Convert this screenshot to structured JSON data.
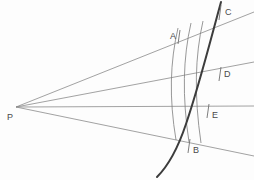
{
  "figure": {
    "background_color": "#fdfdfd",
    "width": 254,
    "height": 180
  },
  "colors": {
    "thin_line": "#8a8a8a",
    "arc_line": "#7d7d7d",
    "thick_curve": "#3c3c3c",
    "tick": "#6f6f6f",
    "label_text": "#4a4a4a"
  },
  "vertex": {
    "name": "P",
    "label": "P",
    "x": 16,
    "y": 107,
    "label_x": 7,
    "label_y": 113
  },
  "labels": [
    {
      "id": "A",
      "text": "A",
      "x": 170,
      "y": 32
    },
    {
      "id": "C",
      "text": "C",
      "x": 225,
      "y": 8
    },
    {
      "id": "D",
      "text": "D",
      "x": 224,
      "y": 70
    },
    {
      "id": "E",
      "text": "E",
      "x": 212,
      "y": 111
    },
    {
      "id": "B",
      "text": "B",
      "x": 193,
      "y": 146
    },
    {
      "id": "P",
      "text": "P",
      "x": 7,
      "y": 113
    }
  ],
  "rays": [
    {
      "id": "ray-to-C",
      "from_x": 16,
      "from_y": 107,
      "to_x": 254,
      "to_y": 12
    },
    {
      "id": "ray-to-D",
      "from_x": 16,
      "from_y": 107,
      "to_x": 254,
      "to_y": 62
    },
    {
      "id": "ray-to-E",
      "from_x": 16,
      "from_y": 107,
      "to_x": 254,
      "to_y": 106
    },
    {
      "id": "ray-to-B",
      "from_x": 16,
      "from_y": 107,
      "to_x": 254,
      "to_y": 156
    }
  ],
  "arcs": [
    {
      "id": "arc-1",
      "path": "M 178 28 C 170 62, 169 98, 176 140"
    },
    {
      "id": "arc-2",
      "path": "M 191 23 C 183 58, 182 96, 189 142"
    },
    {
      "id": "arc-3",
      "path": "M 203 21 C 195 56, 194 95, 201 143"
    }
  ],
  "thick_curve": {
    "id": "parabola-arc",
    "path": "M 221 2 C 210 42, 199 86, 186 124 C 178 148, 168 166, 157 177",
    "stroke_width": 2.0
  },
  "ticks": [
    {
      "id": "tick-A",
      "x1": 180,
      "y1": 30,
      "x2": 178,
      "y2": 44
    },
    {
      "id": "tick-C",
      "x1": 221,
      "y1": 5,
      "x2": 219,
      "y2": 20
    },
    {
      "id": "tick-D",
      "x1": 221,
      "y1": 67,
      "x2": 219,
      "y2": 81
    },
    {
      "id": "tick-E",
      "x1": 209,
      "y1": 104,
      "x2": 207,
      "y2": 118
    },
    {
      "id": "tick-B",
      "x1": 190,
      "y1": 139,
      "x2": 188,
      "y2": 153
    }
  ]
}
